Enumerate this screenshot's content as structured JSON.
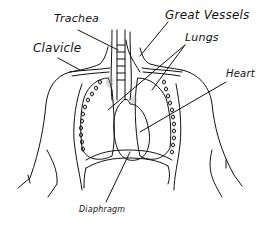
{
  "diagram": {
    "type": "anatomical line drawing of the human thorax",
    "labels": {
      "trachea": "Trachea",
      "great_vessels": "Great Vessels",
      "lungs": "Lungs",
      "clavicle": "Clavicle",
      "heart": "Heart",
      "diaphragm": "Diaphragm"
    },
    "colors": {
      "ink": "#111111",
      "background": "#ffffff",
      "shading": "#999999"
    }
  }
}
